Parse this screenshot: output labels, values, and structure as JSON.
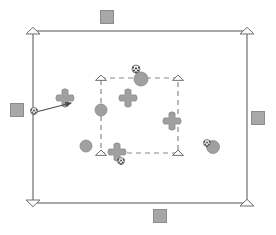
{
  "figure": {
    "title": "",
    "background_color": "#ffffff",
    "width": 276,
    "height": 235
  },
  "colors": {
    "line_stroke": "#707070",
    "dashed_stroke": "#8a8a8a",
    "marker_fill_gray": "#a0a0a0",
    "marker_stroke_gray": "#888888",
    "square_fill": "#a8a8a8",
    "square_stroke": "#8c8c8c",
    "open_marker_fill": "#ffffff",
    "open_marker_stroke": "#6e6e6e",
    "ball_fill": "#f2f2f2",
    "ball_spot": "#4a4a4a",
    "arrow_color": "#4a4a4a"
  },
  "outer_boundary": {
    "shape_name": "outer-rectangle",
    "style": "solid",
    "x1": 33,
    "y1": 31,
    "x2": 247,
    "y2": 203,
    "corner_marker": "open-triangle",
    "corners": [
      {
        "label": "top-left",
        "x": 33,
        "y": 31,
        "orientation": "up"
      },
      {
        "label": "top-right",
        "x": 247,
        "y": 31,
        "orientation": "up"
      },
      {
        "label": "bottom-left",
        "x": 33,
        "y": 203,
        "orientation": "down"
      },
      {
        "label": "bottom-right",
        "x": 247,
        "y": 203,
        "orientation": "up"
      }
    ]
  },
  "inner_boundary": {
    "shape_name": "inner-rectangle",
    "style": "dashed",
    "x1": 101,
    "y1": 78,
    "x2": 178,
    "y2": 153,
    "dash_pattern": "5 4",
    "corner_marker": "open-triangle",
    "corners": [
      {
        "label": "top-left",
        "x": 101,
        "y": 78,
        "orientation": "up"
      },
      {
        "label": "top-right",
        "x": 178,
        "y": 78,
        "orientation": "up"
      },
      {
        "label": "bottom-left",
        "x": 101,
        "y": 153,
        "orientation": "up"
      },
      {
        "label": "bottom-right",
        "x": 178,
        "y": 153,
        "orientation": "up"
      }
    ]
  },
  "squares": [
    {
      "name": "square-top",
      "x": 107,
      "y": 17,
      "size": 13
    },
    {
      "name": "square-left",
      "x": 17,
      "y": 110,
      "size": 13
    },
    {
      "name": "square-right",
      "x": 258,
      "y": 118,
      "size": 13
    },
    {
      "name": "square-bottom",
      "x": 160,
      "y": 216,
      "size": 13
    }
  ],
  "circles": [
    {
      "name": "circle-1",
      "x": 141,
      "y": 79,
      "r": 7
    },
    {
      "name": "circle-2",
      "x": 101,
      "y": 110,
      "r": 6
    },
    {
      "name": "circle-3",
      "x": 86,
      "y": 146,
      "r": 6
    },
    {
      "name": "circle-4",
      "x": 213,
      "y": 147,
      "r": 6.5
    }
  ],
  "flowers": [
    {
      "name": "flower-1",
      "x": 65,
      "y": 98,
      "r": 8
    },
    {
      "name": "flower-2",
      "x": 128,
      "y": 98,
      "r": 8
    },
    {
      "name": "flower-3",
      "x": 172,
      "y": 121,
      "r": 8
    },
    {
      "name": "flower-4",
      "x": 117,
      "y": 152,
      "r": 8
    }
  ],
  "balls": [
    {
      "name": "ball-1",
      "x": 136,
      "y": 69,
      "r": 4
    },
    {
      "name": "ball-2",
      "x": 34,
      "y": 111,
      "r": 3.5
    },
    {
      "name": "ball-3",
      "x": 121,
      "y": 161,
      "r": 3.5
    },
    {
      "name": "ball-4",
      "x": 207,
      "y": 143,
      "r": 3.5
    }
  ],
  "arrow": {
    "name": "velocity-arrow",
    "from_x": 36,
    "from_y": 112,
    "to_x": 71,
    "to_y": 103
  }
}
